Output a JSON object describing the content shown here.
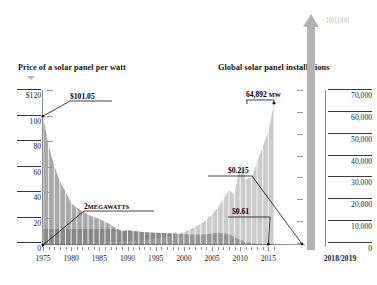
{
  "headings": {
    "left": "Price of a solar panel per watt",
    "right": "Global solar panel installations"
  },
  "arrow": {
    "label": ">100,000"
  },
  "axes": {
    "left_title_prefix": "$",
    "left_ticks": [
      "$120",
      "100",
      "80",
      "60",
      "40",
      "20",
      "0"
    ],
    "right_ticks": [
      "70,000",
      "60,000",
      "50,000",
      "40,000",
      "30,000",
      "20,000",
      "10,000",
      "0"
    ],
    "x_ticks": [
      "1975",
      "1980",
      "1985",
      "1990",
      "1995",
      "2000",
      "2005",
      "2010",
      "2015",
      "2018/2019"
    ]
  },
  "callouts": {
    "price_start": "$101.05",
    "install_start_num": "2",
    "install_start_unit": "MEGAWATTS",
    "install_peak_num": "64,892",
    "install_peak_unit": "MW",
    "price_2010": "$0.215",
    "price_2015": "$0.61"
  },
  "colors": {
    "price_area": "#a9a9a9",
    "install_area": "#c8c8c8",
    "dark_band": "#6f6f6f",
    "arrow": "#b3b3b3",
    "arrow_label": "#c2c2c2",
    "axis": "#3a3a3a",
    "gridline": "#ffffff",
    "text": "#111111"
  },
  "chart_data": {
    "type": "area",
    "xlabel": "",
    "ylabel": "Price ($/watt)",
    "y2label": "Installations (MW)",
    "ylim": [
      0,
      120
    ],
    "y2lim": [
      0,
      70000
    ],
    "xlim": [
      1975,
      2019
    ],
    "grid": true,
    "legend_position": "none",
    "annotations": [
      {
        "text": "$101.05",
        "x": 1975,
        "y": 101.05,
        "series": "price"
      },
      {
        "text": "2 MEGAWATTS",
        "x": 1975,
        "y": 2,
        "series": "installations"
      },
      {
        "text": "64,892 MW",
        "x": 2016,
        "y": 64892,
        "series": "installations"
      },
      {
        "text": "$0.215",
        "x": 2019,
        "y": 0.215,
        "series": "price"
      },
      {
        "text": "$0.61",
        "x": 2015,
        "y": 0.61,
        "series": "price"
      },
      {
        "text": ">100,000",
        "x": 2019,
        "y": 100000,
        "series": "installations"
      }
    ],
    "x": [
      1975,
      1976,
      1977,
      1978,
      1979,
      1980,
      1981,
      1982,
      1983,
      1984,
      1985,
      1986,
      1987,
      1988,
      1989,
      1990,
      1991,
      1992,
      1993,
      1994,
      1995,
      1996,
      1997,
      1998,
      1999,
      2000,
      2001,
      2002,
      2003,
      2004,
      2005,
      2006,
      2007,
      2008,
      2009,
      2010,
      2011,
      2012,
      2013,
      2014,
      2015,
      2016,
      2017,
      2018,
      2019
    ],
    "series": [
      {
        "name": "Price of a solar panel per watt",
        "axis": "left",
        "unit": "USD per watt",
        "values": [
          101.05,
          78.0,
          62.0,
          50.0,
          42.0,
          33.0,
          29.0,
          26.5,
          24.0,
          22.0,
          20.5,
          18.0,
          16.0,
          13.0,
          11.0,
          11.5,
          11.0,
          10.5,
          10.0,
          9.8,
          9.6,
          9.4,
          9.2,
          9.0,
          8.8,
          8.6,
          8.5,
          8.3,
          8.2,
          8.4,
          9.0,
          9.6,
          9.2,
          8.6,
          6.0,
          4.0,
          2.2,
          1.3,
          1.0,
          0.85,
          0.72,
          0.61,
          0.45,
          0.3,
          0.215
        ]
      },
      {
        "name": "Global solar panel installations",
        "axis": "right",
        "unit": "MW",
        "values": [
          2,
          20,
          60,
          120,
          200,
          320,
          450,
          560,
          680,
          800,
          920,
          1050,
          1200,
          1400,
          1600,
          1800,
          2000,
          2200,
          2400,
          2700,
          3000,
          3400,
          3900,
          4500,
          5200,
          6000,
          7000,
          8200,
          9600,
          11500,
          14000,
          17000,
          21000,
          25000,
          23000,
          38000,
          30000,
          31000,
          38000,
          45000,
          52000,
          64892,
          null,
          null,
          null
        ]
      }
    ]
  }
}
